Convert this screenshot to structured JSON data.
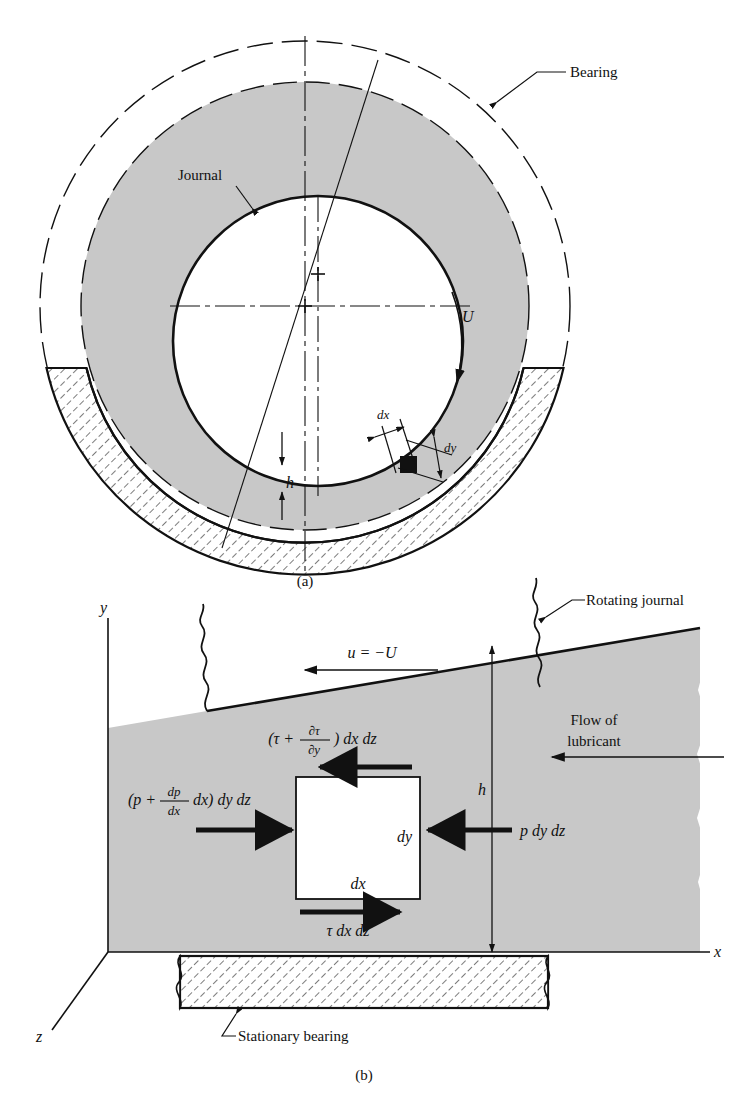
{
  "figure": {
    "panel_a": {
      "caption": "(a)",
      "labels": {
        "bearing": "Bearing",
        "journal": "Journal",
        "velocity": "U",
        "film_thickness": "h",
        "dx": "dx",
        "dy": "dy"
      }
    },
    "panel_b": {
      "caption": "(b)",
      "labels": {
        "rotating_journal": "Rotating journal",
        "stationary_bearing": "Stationary bearing",
        "flow_of_lubricant_line1": "Flow of",
        "flow_of_lubricant_line2": "lubricant",
        "surface_velocity": "u = −U",
        "film_thickness": "h",
        "axis_x": "x",
        "axis_y": "y",
        "axis_z": "z",
        "element_dx": "dx",
        "element_dy": "dy"
      },
      "forces": {
        "shear_top_prefix": "(τ +",
        "shear_top_num": "∂τ",
        "shear_top_den": "∂y",
        "shear_top_suffix": ") dx dz",
        "pressure_left_prefix": "(p +",
        "pressure_left_num": "dp",
        "pressure_left_den": "dx",
        "pressure_left_mid": "dx) dy dz",
        "pressure_right": "p dy dz",
        "shear_bottom": "τ dx dz"
      }
    },
    "colors": {
      "lubricant_fill": "#c8c8c8",
      "line": "#111111",
      "hatch": "#111111",
      "background": "#ffffff"
    }
  }
}
